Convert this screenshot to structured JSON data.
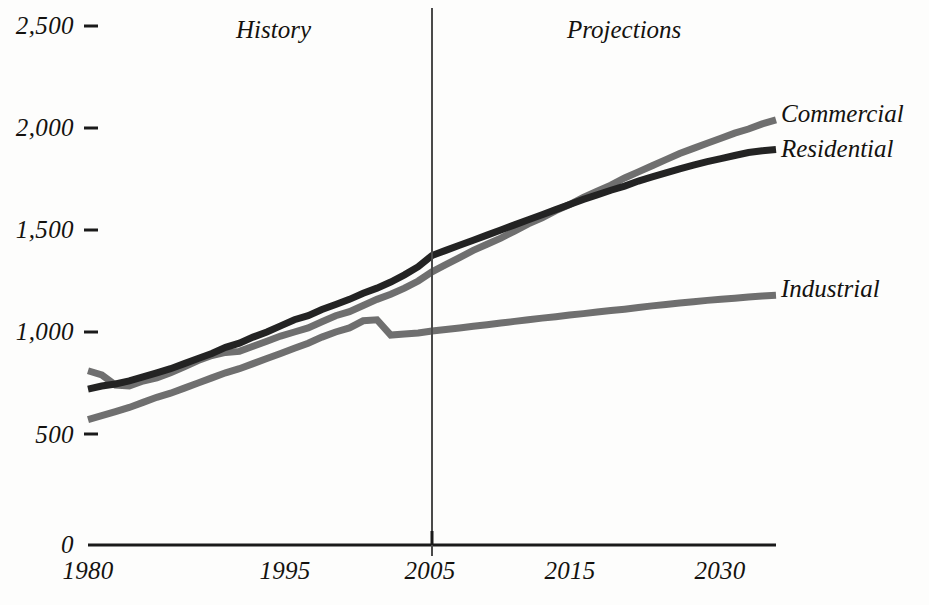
{
  "chart_data": {
    "type": "line",
    "title": "",
    "subtitle": "",
    "xlabel": "",
    "ylabel": "",
    "xlim": [
      1980,
      2030
    ],
    "ylim": [
      0,
      2500
    ],
    "grid": false,
    "legend_position": "right-inline-end-of-line",
    "axis_note": "y-axis has a visual break between 0 and 500",
    "xticks": [
      "1980",
      "1995",
      "2005",
      "2015",
      "2030"
    ],
    "xtick_values": [
      1980,
      1995,
      2005,
      2015,
      2030
    ],
    "yticks": [
      "0",
      "500",
      "1,000",
      "1,500",
      "2,000",
      "2,500"
    ],
    "ytick_values": [
      0,
      500,
      1000,
      1500,
      2000,
      2500
    ],
    "annotations": [
      {
        "text": "History",
        "x": 1992
      },
      {
        "text": "Projections",
        "x": 2017
      }
    ],
    "divider_year": 2005,
    "x": [
      1980,
      1981,
      1982,
      1983,
      1984,
      1985,
      1986,
      1987,
      1988,
      1989,
      1990,
      1991,
      1992,
      1993,
      1994,
      1995,
      1996,
      1997,
      1998,
      1999,
      2000,
      2001,
      2002,
      2003,
      2004,
      2005,
      2006,
      2007,
      2008,
      2009,
      2010,
      2011,
      2012,
      2013,
      2014,
      2015,
      2016,
      2017,
      2018,
      2019,
      2020,
      2021,
      2022,
      2023,
      2024,
      2025,
      2026,
      2027,
      2028,
      2029,
      2030
    ],
    "series": [
      {
        "name": "Commercial",
        "color": "#6f6f6f",
        "values": [
          810,
          790,
          740,
          735,
          760,
          775,
          800,
          830,
          860,
          885,
          900,
          905,
          930,
          955,
          980,
          1000,
          1020,
          1050,
          1080,
          1100,
          1130,
          1160,
          1185,
          1215,
          1250,
          1295,
          1330,
          1365,
          1400,
          1430,
          1460,
          1495,
          1530,
          1560,
          1595,
          1625,
          1660,
          1690,
          1720,
          1755,
          1785,
          1815,
          1845,
          1875,
          1900,
          1925,
          1950,
          1975,
          1995,
          2020,
          2040
        ]
      },
      {
        "name": "Residential",
        "color": "#232323",
        "values": [
          720,
          735,
          745,
          760,
          780,
          800,
          820,
          845,
          870,
          895,
          925,
          945,
          975,
          1000,
          1030,
          1060,
          1080,
          1110,
          1135,
          1160,
          1190,
          1215,
          1245,
          1280,
          1320,
          1375,
          1400,
          1425,
          1450,
          1475,
          1500,
          1525,
          1550,
          1575,
          1600,
          1625,
          1650,
          1672,
          1695,
          1715,
          1740,
          1760,
          1780,
          1800,
          1818,
          1835,
          1850,
          1865,
          1880,
          1888,
          1895
        ]
      },
      {
        "name": "Industrial",
        "color": "#6f6f6f",
        "values": [
          570,
          590,
          610,
          630,
          655,
          680,
          700,
          725,
          750,
          775,
          800,
          820,
          845,
          870,
          895,
          920,
          945,
          975,
          1000,
          1020,
          1055,
          1060,
          985,
          990,
          995,
          1005,
          1012,
          1020,
          1028,
          1036,
          1044,
          1052,
          1060,
          1068,
          1075,
          1083,
          1090,
          1098,
          1105,
          1112,
          1120,
          1128,
          1135,
          1142,
          1148,
          1155,
          1160,
          1166,
          1172,
          1176,
          1180
        ]
      }
    ]
  },
  "labels": {
    "commercial": "Commercial",
    "residential": "Residential",
    "industrial": "Industrial",
    "history": "History",
    "projections": "Projections"
  },
  "axis": {
    "y_2500": "2,500",
    "y_2000": "2,000",
    "y_1500": "1,500",
    "y_1000": "1,000",
    "y_500": "500",
    "y_0": "0",
    "x_1980": "1980",
    "x_1995": "1995",
    "x_2005": "2005",
    "x_2015": "2015",
    "x_2030": "2030"
  },
  "colors": {
    "commercial": "#6f6f6f",
    "residential": "#232323",
    "industrial": "#6f6f6f",
    "axis": "#1a1a1a",
    "background": "#fdfdfc"
  }
}
